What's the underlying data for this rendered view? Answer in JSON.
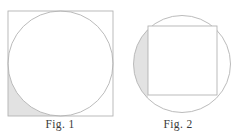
{
  "page": {
    "background_color": "#ffffff",
    "width": 238,
    "height": 134
  },
  "style": {
    "stroke_color": "#b3b3b3",
    "stroke_width": 0.9,
    "shade_color": "#e2e2e2",
    "fill_color": "#ffffff",
    "caption_color": "#3a3a3a"
  },
  "figures": [
    {
      "id": "fig-1",
      "caption": "Fig. 1",
      "description": "square with inscribed circle, bottom-left corner region shaded",
      "square": {
        "x": 8,
        "y": 11,
        "size": 105
      },
      "circle": {
        "cx": 60.5,
        "cy": 63.5,
        "r": 52.5
      },
      "shaded_region": "bottom-left-corner"
    },
    {
      "id": "fig-2",
      "caption": "Fig. 2",
      "description": "circle with inscribed square, left crescent region shaded",
      "circle": {
        "cx": 64,
        "cy": 64,
        "r": 48.5
      },
      "square": {
        "x": 30,
        "y": 26,
        "size": 69
      },
      "shaded_region": "left-crescent"
    }
  ]
}
